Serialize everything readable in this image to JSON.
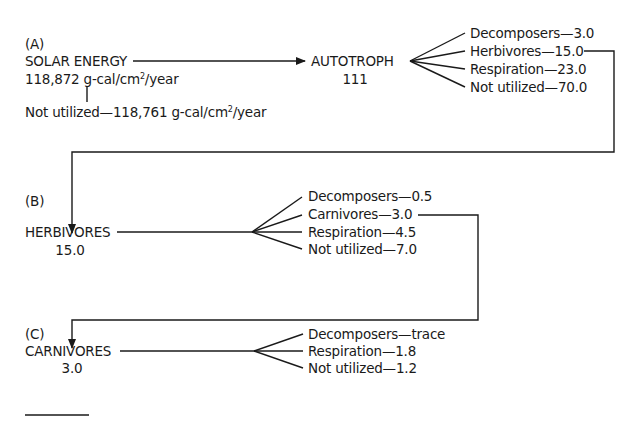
{
  "sections": {
    "a": {
      "label": "(A)",
      "source": {
        "name": "SOLAR ENERGY",
        "value_prefix": "118,872 g-cal/cm",
        "value_sup": "2",
        "value_suffix": "/year"
      },
      "not_utilized": {
        "prefix": "Not utilized—118,761 g-cal/cm",
        "sup": "2",
        "suffix": "/year"
      },
      "node": {
        "name": "AUTOTROPH",
        "value": "111"
      },
      "branches": [
        {
          "label": "Decomposers—3.0"
        },
        {
          "label": "Herbivores—15.0"
        },
        {
          "label": "Respiration—23.0"
        },
        {
          "label": "Not utilized—70.0"
        }
      ]
    },
    "b": {
      "label": "(B)",
      "node": {
        "name": "HERBIVORES",
        "value": "15.0"
      },
      "branches": [
        {
          "label": "Decomposers—0.5"
        },
        {
          "label": "Carnivores—3.0"
        },
        {
          "label": "Respiration—4.5"
        },
        {
          "label": "Not utilized—7.0"
        }
      ]
    },
    "c": {
      "label": "(C)",
      "node": {
        "name": "CARNIVORES",
        "value": "3.0"
      },
      "branches": [
        {
          "label": "Decomposers—trace"
        },
        {
          "label": "Respiration—1.8"
        },
        {
          "label": "Not utilized—1.2"
        }
      ]
    }
  },
  "colors": {
    "ink": "#1a1a1a",
    "background": "#ffffff"
  }
}
